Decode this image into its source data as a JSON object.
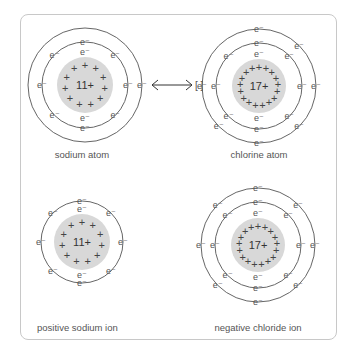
{
  "figure": {
    "arrow": "↔",
    "brackets": "[ ]",
    "colors": {
      "nucleus_fill": "#d8d8d8",
      "shell_stroke": "#666666",
      "frame_stroke": "#c8c8c8",
      "text": "#555555"
    },
    "panels": [
      {
        "id": "sodium-atom",
        "label": "sodium atom",
        "charge": "11+",
        "protons": 11,
        "shells": [
          2,
          8,
          1
        ],
        "electron_symbol": "e⁻"
      },
      {
        "id": "chlorine-atom",
        "label": "chlorine atom",
        "charge": "17+",
        "protons": 17,
        "shells": [
          2,
          8,
          7
        ],
        "electron_symbol": "e⁻"
      },
      {
        "id": "sodium-ion",
        "label": "positive sodium ion",
        "charge": "11+",
        "protons": 11,
        "shells": [
          2,
          8
        ],
        "electron_symbol": "e⁻"
      },
      {
        "id": "chloride-ion",
        "label": "negative chloride ion",
        "charge": "17+",
        "protons": 17,
        "shells": [
          2,
          8,
          8
        ],
        "electron_symbol": "e⁻"
      }
    ]
  }
}
